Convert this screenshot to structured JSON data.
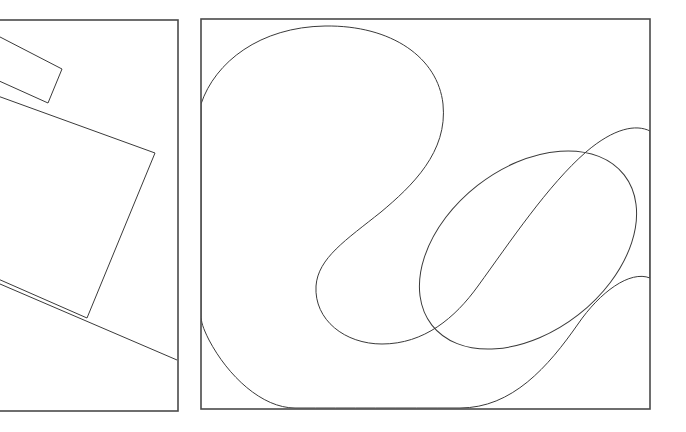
{
  "figure": {
    "background_color": "#ffffff",
    "stroke_color": "#3a3a3a",
    "panel_border_color": "#4a4a4a",
    "canvas_width": 686,
    "canvas_height": 432,
    "caption": "",
    "panels": [
      {
        "name": "left-panel",
        "label": "",
        "frame": {
          "x": -120,
          "y": 20,
          "width": 298,
          "height": 391
        },
        "clipped_left_edge": true,
        "content_type": "straight-edge-polygons",
        "shapes": [
          {
            "name": "small-quadrilateral",
            "type": "polygon",
            "points": "-60,6 62,69 48,103 -74,48"
          },
          {
            "name": "large-quadrilateral",
            "type": "polygon",
            "points": "-96,62 155,153 87,318 -150,214"
          },
          {
            "name": "long-diagonal-edge",
            "type": "polyline",
            "points": "-120,252 0,284 177,360"
          }
        ]
      },
      {
        "name": "right-panel",
        "label": "",
        "frame": {
          "x": 201,
          "y": 19,
          "width": 449,
          "height": 390
        },
        "clipped_left_edge": false,
        "content_type": "smooth-closed-curves",
        "shapes": [
          {
            "name": "outer-s-curve-region",
            "type": "closed-bezier",
            "path": "M 201,104 C 215,62 260,27 325,26 C 392,25 438,58 443,104 C 448,152 412,186 381,212 C 346,240 318,258 316,286 C 314,320 345,344 382,344 C 424,344 455,318 478,286 C 510,242 548,185 586,152 C 614,128 636,124 650,131 L 650,278 C 630,270 600,292 578,324 C 548,367 512,408 460,408 C 400,408 350,408 295,408 C 262,408 228,376 209,340 C 203,328 201,322 201,315 Z"
          },
          {
            "name": "inner-ellipse",
            "type": "ellipse",
            "cx": 528,
            "cy": 250,
            "rx": 122,
            "ry": 82,
            "rotation": -38
          }
        ]
      }
    ]
  }
}
